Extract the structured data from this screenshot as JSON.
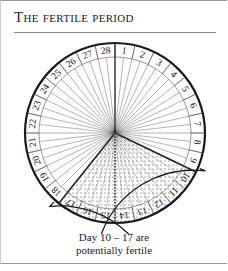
{
  "title": "The fertile period",
  "diagram": {
    "center": [
      115,
      133
    ],
    "radius": 90,
    "inner_radius": 76,
    "days": [
      "1",
      "2",
      "3",
      "4",
      "5",
      "6",
      "7",
      "8",
      "9",
      "10",
      "11",
      "12",
      "13",
      "14",
      "15",
      "16",
      "17",
      "18",
      "19",
      "20",
      "21",
      "22",
      "23",
      "24",
      "25",
      "26",
      "27",
      "28"
    ],
    "fertile_range": [
      10,
      17
    ],
    "fertile_fill": "dotted",
    "line_color": "#1a1a1a"
  },
  "caption": {
    "line1": "Day 10 – 17 are",
    "line2": "potentially fertile"
  }
}
